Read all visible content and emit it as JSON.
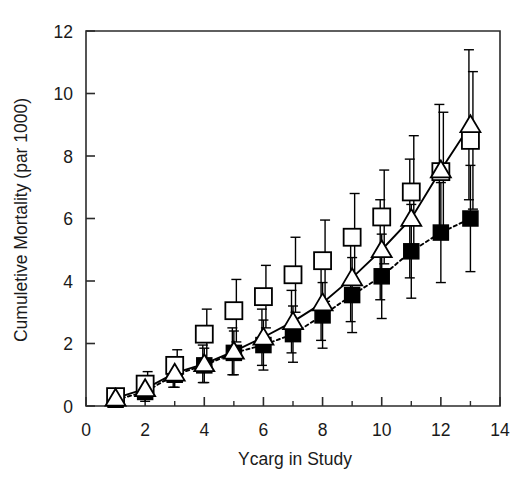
{
  "chart_data": {
    "type": "line",
    "title": "",
    "xlabel": "Ycarg in Study",
    "ylabel": "Cumuletive Mortality  (par 1000)",
    "xlim": [
      0,
      14
    ],
    "ylim": [
      0,
      12
    ],
    "xticks": [
      0,
      2,
      4,
      6,
      8,
      10,
      12,
      14
    ],
    "xticklabels": [
      "0",
      "2",
      "4",
      "6",
      "8",
      "10",
      "12",
      "14"
    ],
    "xminorticks": [
      1,
      3,
      5,
      7,
      9,
      11,
      13
    ],
    "yticks": [
      0,
      2,
      4,
      6,
      8,
      10,
      12
    ],
    "yticklabels": [
      "0",
      "2",
      "4",
      "6",
      "8",
      "10",
      "12"
    ],
    "grid": false,
    "legend": "none",
    "x": [
      1,
      2,
      3,
      4,
      5,
      6,
      7,
      8,
      9,
      10,
      11,
      12,
      13
    ],
    "series": [
      {
        "name": "open-square",
        "marker": "open-square",
        "line": "none",
        "color": "#000000",
        "values": [
          0.3,
          0.7,
          1.3,
          2.3,
          3.05,
          3.5,
          4.2,
          4.65,
          5.4,
          6.05,
          6.85,
          7.5,
          8.5
        ],
        "err_lo": [
          0.2,
          0.4,
          0.5,
          0.8,
          1.0,
          1.0,
          1.2,
          1.3,
          1.4,
          1.5,
          1.8,
          1.9,
          2.2
        ],
        "err_hi": [
          0.2,
          0.4,
          0.5,
          0.8,
          1.0,
          1.0,
          1.2,
          1.3,
          1.4,
          1.5,
          1.8,
          1.9,
          2.2
        ]
      },
      {
        "name": "open-triangle",
        "marker": "open-triangle",
        "line": "solid",
        "color": "#000000",
        "values": [
          0.25,
          0.55,
          1.05,
          1.35,
          1.75,
          2.2,
          2.7,
          3.3,
          4.1,
          5.0,
          6.0,
          7.55,
          9.0
        ],
        "err_lo": [
          0.15,
          0.3,
          0.45,
          0.6,
          0.75,
          0.9,
          1.0,
          1.2,
          1.4,
          1.6,
          1.9,
          2.1,
          2.4
        ],
        "err_hi": [
          0.15,
          0.3,
          0.45,
          0.6,
          0.75,
          0.9,
          1.0,
          1.2,
          1.4,
          1.6,
          1.9,
          2.1,
          2.4
        ]
      },
      {
        "name": "filled-square",
        "marker": "filled-square",
        "line": "dotted",
        "color": "#000000",
        "values": [
          0.2,
          0.45,
          1.0,
          1.3,
          1.7,
          1.95,
          2.3,
          2.9,
          3.55,
          4.15,
          4.95,
          5.55,
          6.0
        ],
        "err_lo": [
          0.15,
          0.3,
          0.4,
          0.55,
          0.7,
          0.8,
          0.9,
          1.05,
          1.2,
          1.35,
          1.5,
          1.6,
          1.7
        ],
        "err_hi": [
          0.15,
          0.3,
          0.4,
          0.55,
          0.7,
          0.8,
          0.9,
          1.05,
          1.2,
          1.35,
          1.5,
          1.6,
          1.7
        ]
      }
    ]
  }
}
